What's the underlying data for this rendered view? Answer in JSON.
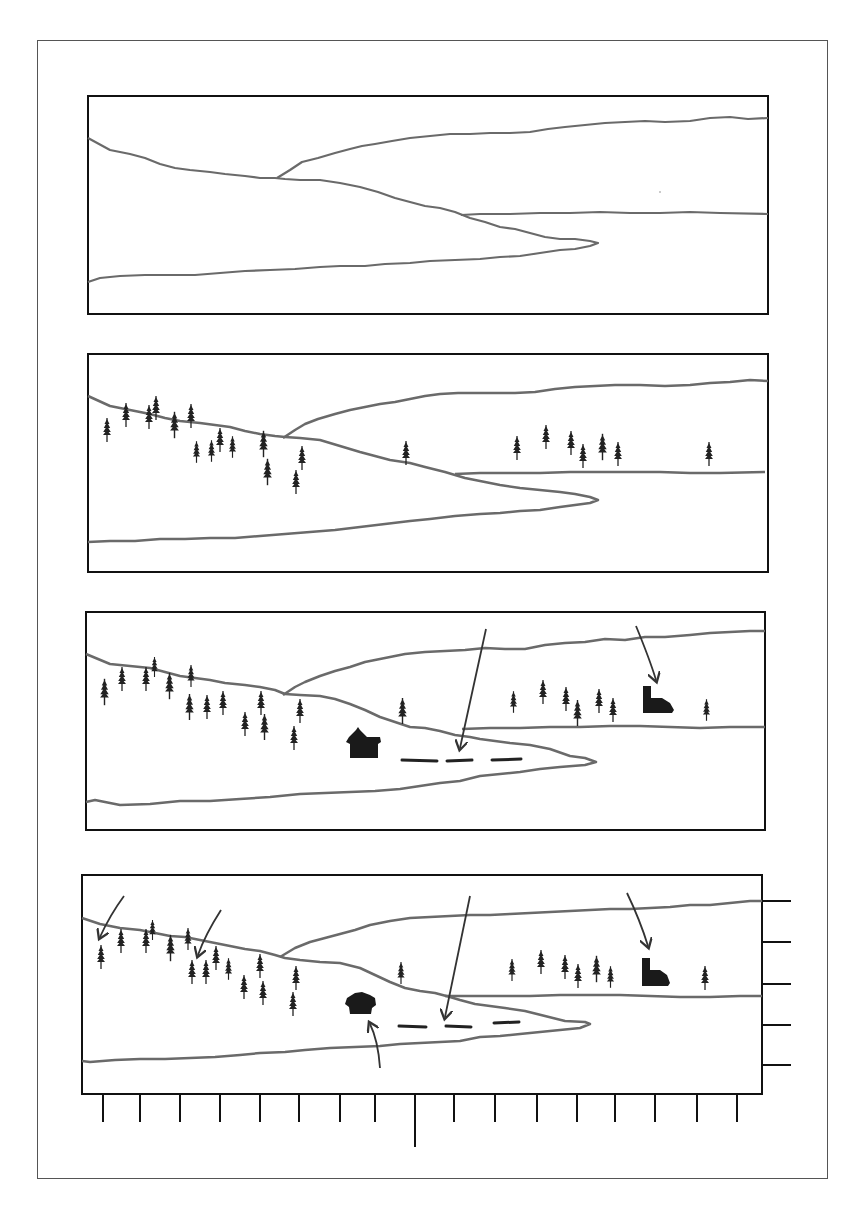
{
  "figure": {
    "colors": {
      "line": "#6a6a6a",
      "ink": "#222222",
      "frame": "#111111",
      "sheet_border": "#555555"
    },
    "panels": [
      {
        "id": 1,
        "stage": "outline",
        "elements": [
          "far-ridge-line",
          "near-hill-line",
          "shoreline",
          "spit-outline"
        ]
      },
      {
        "id": 2,
        "stage": "trees-added",
        "elements": [
          "outline",
          "conifer-trees"
        ]
      },
      {
        "id": 3,
        "stage": "focal-points",
        "elements": [
          "outline",
          "conifer-trees",
          "cabin",
          "boat-dock-dashes",
          "church",
          "arrows"
        ],
        "arrow_count": 2
      },
      {
        "id": 4,
        "stage": "grid-measurement",
        "elements": [
          "outline",
          "conifer-trees",
          "cabin",
          "boat-dock-dashes",
          "church",
          "arrows",
          "bottom-ticks",
          "right-ticks"
        ],
        "arrow_count": 5,
        "bottom_tick_count": 17,
        "right_tick_count": 5
      }
    ]
  }
}
